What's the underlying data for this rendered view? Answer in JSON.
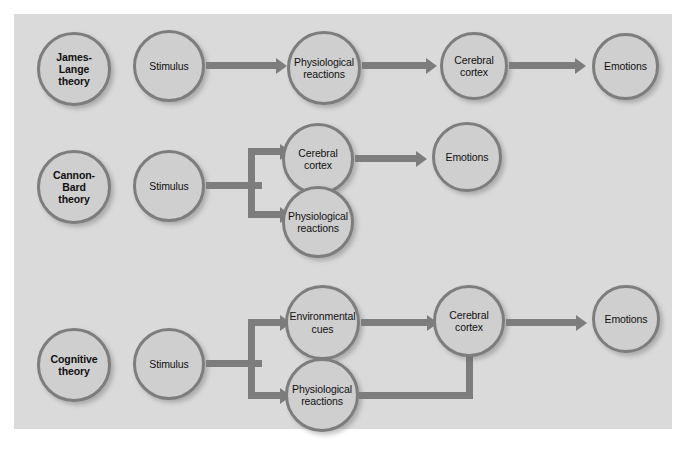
{
  "diagram": {
    "panel_color": "#d7d7d7",
    "node_fill": "#cfcfcf",
    "node_stroke": "#7d7d7d",
    "arrow_color": "#7d7d7d",
    "rows": [
      {
        "id": "james-lange",
        "theory_label": "James-Lange\ntheory",
        "nodes": [
          {
            "id": "jl-theory",
            "label": "James-Lange theory"
          },
          {
            "id": "jl-stimulus",
            "label": "Stimulus"
          },
          {
            "id": "jl-physio",
            "label": "Physiological reactions"
          },
          {
            "id": "jl-cortex",
            "label": "Cerebral cortex"
          },
          {
            "id": "jl-emotions",
            "label": "Emotions"
          }
        ],
        "edges": [
          {
            "from": "jl-stimulus",
            "to": "jl-physio"
          },
          {
            "from": "jl-physio",
            "to": "jl-cortex"
          },
          {
            "from": "jl-cortex",
            "to": "jl-emotions"
          }
        ]
      },
      {
        "id": "cannon-bard",
        "theory_label": "Cannon-Bard\ntheory",
        "nodes": [
          {
            "id": "cb-theory",
            "label": "Cannon-Bard theory"
          },
          {
            "id": "cb-stimulus",
            "label": "Stimulus"
          },
          {
            "id": "cb-cortex",
            "label": "Cerebral cortex"
          },
          {
            "id": "cb-physio",
            "label": "Physiological reactions"
          },
          {
            "id": "cb-emotions",
            "label": "Emotions"
          }
        ],
        "edges": [
          {
            "from": "cb-stimulus",
            "to": "cb-cortex"
          },
          {
            "from": "cb-stimulus",
            "to": "cb-physio"
          },
          {
            "from": "cb-cortex",
            "to": "cb-emotions"
          }
        ]
      },
      {
        "id": "cognitive",
        "theory_label": "Cognitive\ntheory",
        "nodes": [
          {
            "id": "cg-theory",
            "label": "Cognitive theory"
          },
          {
            "id": "cg-stimulus",
            "label": "Stimulus"
          },
          {
            "id": "cg-envcues",
            "label": "Environmental cues"
          },
          {
            "id": "cg-physio",
            "label": "Physiological reactions"
          },
          {
            "id": "cg-cortex",
            "label": "Cerebral cortex"
          },
          {
            "id": "cg-emotions",
            "label": "Emotions"
          }
        ],
        "edges": [
          {
            "from": "cg-stimulus",
            "to": "cg-envcues"
          },
          {
            "from": "cg-stimulus",
            "to": "cg-physio"
          },
          {
            "from": "cg-envcues",
            "to": "cg-cortex"
          },
          {
            "from": "cg-physio",
            "to": "cg-cortex"
          },
          {
            "from": "cg-cortex",
            "to": "cg-emotions"
          }
        ]
      }
    ],
    "labels": {
      "james_lange_theory": "James-Lange\ntheory",
      "cannon_bard_theory": "Cannon-Bard\ntheory",
      "cognitive_theory": "Cognitive\ntheory",
      "stimulus": "Stimulus",
      "physiological_reactions": "Physiological\nreactions",
      "cerebral_cortex": "Cerebral\ncortex",
      "emotions": "Emotions",
      "environmental_cues": "Environmental\ncues"
    }
  }
}
